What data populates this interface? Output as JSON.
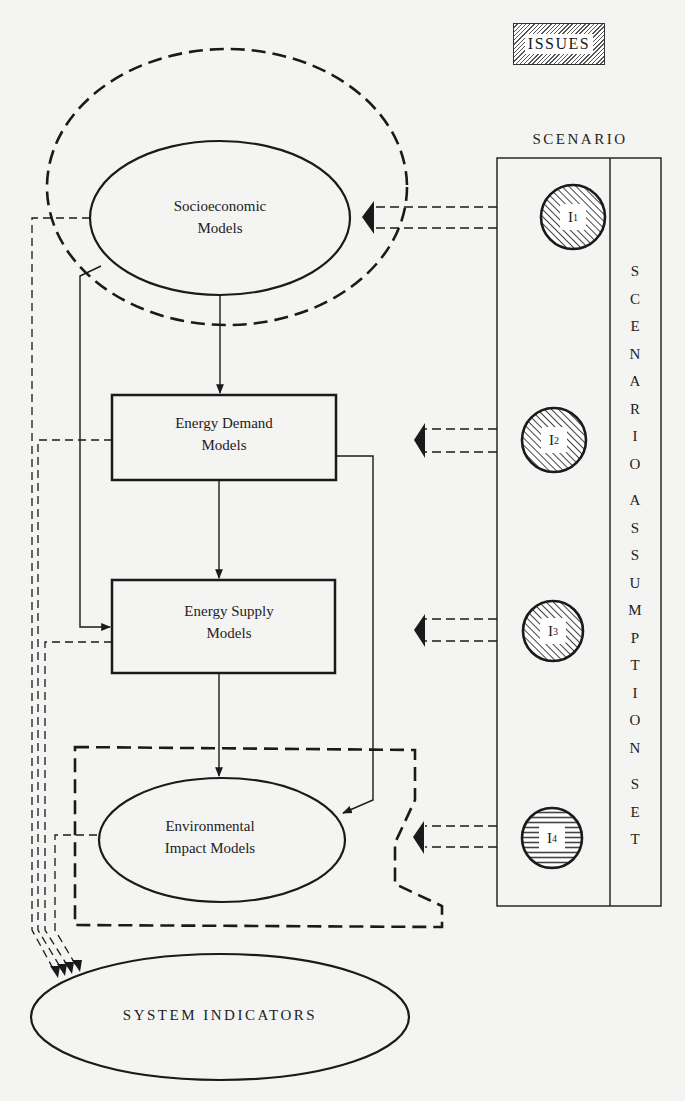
{
  "header": {
    "issues_label": "ISSUES",
    "scenario_label": "SCENARIO"
  },
  "scenario_column": {
    "vertical_text_words": [
      "SCENARIO",
      "ASSUMPTION",
      "SET"
    ],
    "issues": [
      {
        "id": "I1",
        "letter": "I",
        "sub": "1",
        "hatch": "diagonal"
      },
      {
        "id": "I2",
        "letter": "I",
        "sub": "2",
        "hatch": "diagonal"
      },
      {
        "id": "I3",
        "letter": "I",
        "sub": "3",
        "hatch": "diagonal"
      },
      {
        "id": "I4",
        "letter": "I",
        "sub": "4",
        "hatch": "horizontal"
      }
    ]
  },
  "models": {
    "socioeconomic": {
      "line1": "Socioeconomic",
      "line2": "Models"
    },
    "energy_demand": {
      "line1": "Energy Demand",
      "line2": "Models"
    },
    "energy_supply": {
      "line1": "Energy Supply",
      "line2": "Models"
    },
    "environmental": {
      "line1": "Environmental",
      "line2": "Impact Models"
    }
  },
  "output": {
    "system_indicators": "SYSTEM INDICATORS"
  },
  "colors": {
    "ink": "#1a1a1a",
    "paper": "#f4f4f2",
    "hatch": "#555555"
  }
}
